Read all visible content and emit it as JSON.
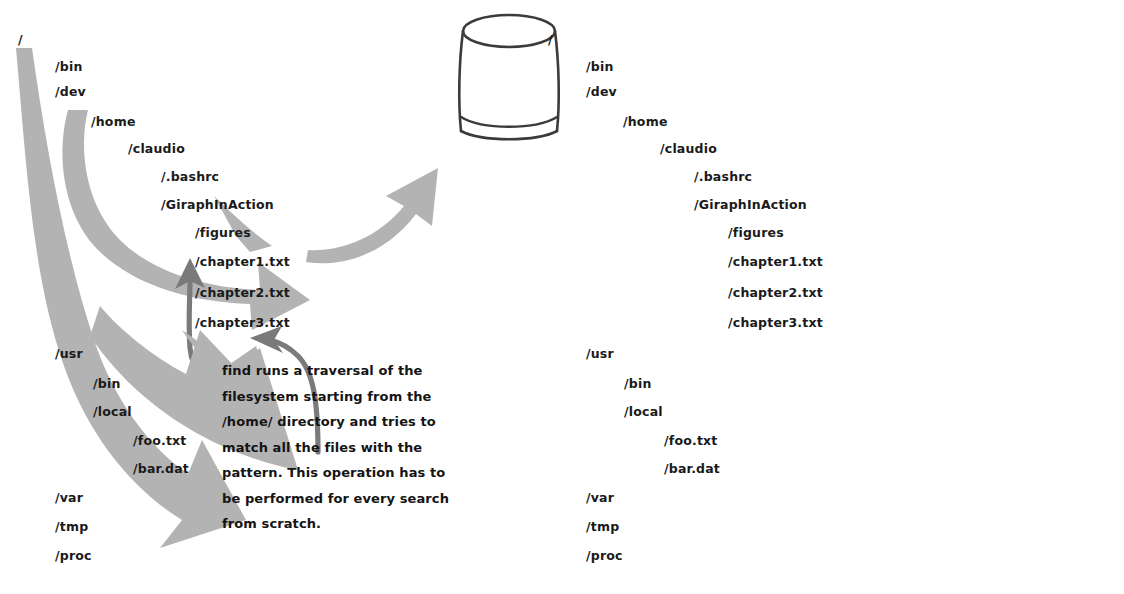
{
  "figure": {
    "background_color": "#ffffff",
    "text_color": "#1a1a1a",
    "arrow_fill": "#b3b3b3",
    "connector_stroke": "#7a7a7a",
    "database_stroke": "#3d3a38"
  },
  "panels": [
    {
      "id": "find",
      "name": "find-traversal-panel",
      "tree": {
        "name": "filesystem-tree-find",
        "nodes": [
          {
            "label": "/",
            "depth": 0,
            "x": 18,
            "y": 34
          },
          {
            "label": "/bin",
            "depth": 1,
            "x": 55,
            "y": 61
          },
          {
            "label": "/dev",
            "depth": 1,
            "x": 55,
            "y": 86
          },
          {
            "label": "/home",
            "depth": 2,
            "x": 91,
            "y": 116
          },
          {
            "label": "/claudio",
            "depth": 3,
            "x": 128,
            "y": 143
          },
          {
            "label": "/.bashrc",
            "depth": 4,
            "x": 161,
            "y": 171
          },
          {
            "label": "/GiraphInAction",
            "depth": 4,
            "x": 161,
            "y": 199
          },
          {
            "label": "/figures",
            "depth": 5,
            "x": 195,
            "y": 227
          },
          {
            "label": "/chapter1.txt",
            "depth": 5,
            "x": 195,
            "y": 256
          },
          {
            "label": "/chapter2.txt",
            "depth": 5,
            "x": 195,
            "y": 287
          },
          {
            "label": "/chapter3.txt",
            "depth": 5,
            "x": 195,
            "y": 317
          },
          {
            "label": "/usr",
            "depth": 1,
            "x": 55,
            "y": 348
          },
          {
            "label": "/bin",
            "depth": 2,
            "x": 93,
            "y": 378
          },
          {
            "label": "/local",
            "depth": 2,
            "x": 93,
            "y": 406
          },
          {
            "label": "/foo.txt",
            "depth": 3,
            "x": 133,
            "y": 435
          },
          {
            "label": "/bar.dat",
            "depth": 3,
            "x": 133,
            "y": 463
          },
          {
            "label": "/var",
            "depth": 1,
            "x": 55,
            "y": 492
          },
          {
            "label": "/tmp",
            "depth": 1,
            "x": 55,
            "y": 521
          },
          {
            "label": "/proc",
            "depth": 1,
            "x": 55,
            "y": 550
          }
        ]
      },
      "caption": {
        "name": "find-caption",
        "text": "find runs a traversal of the\nfilesystem starting from the\n/home/ directory and tries to\nmatch all the files with the\npattern. This operation has to\nbe performed for every search\nfrom scratch."
      },
      "annotations": {
        "traversal_arrow": "sweeping-gray-arrow",
        "connector_arrow": "caption-connector-arrow"
      }
    },
    {
      "id": "locate",
      "name": "locate-traversal-panel",
      "tree": {
        "name": "filesystem-tree-locate",
        "nodes": [
          {
            "label": "/",
            "depth": 0,
            "x": 548,
            "y": 34
          },
          {
            "label": "/bin",
            "depth": 1,
            "x": 586,
            "y": 61
          },
          {
            "label": "/dev",
            "depth": 1,
            "x": 586,
            "y": 86
          },
          {
            "label": "/home",
            "depth": 2,
            "x": 623,
            "y": 116
          },
          {
            "label": "/claudio",
            "depth": 3,
            "x": 660,
            "y": 143
          },
          {
            "label": "/.bashrc",
            "depth": 4,
            "x": 694,
            "y": 171
          },
          {
            "label": "/GiraphInAction",
            "depth": 4,
            "x": 694,
            "y": 199
          },
          {
            "label": "/figures",
            "depth": 5,
            "x": 728,
            "y": 227
          },
          {
            "label": "/chapter1.txt",
            "depth": 5,
            "x": 728,
            "y": 256
          },
          {
            "label": "/chapter2.txt",
            "depth": 5,
            "x": 728,
            "y": 287
          },
          {
            "label": "/chapter3.txt",
            "depth": 5,
            "x": 728,
            "y": 317
          },
          {
            "label": "/usr",
            "depth": 1,
            "x": 586,
            "y": 348
          },
          {
            "label": "/bin",
            "depth": 2,
            "x": 624,
            "y": 378
          },
          {
            "label": "/local",
            "depth": 2,
            "x": 624,
            "y": 406
          },
          {
            "label": "/foo.txt",
            "depth": 3,
            "x": 664,
            "y": 435
          },
          {
            "label": "/bar.dat",
            "depth": 3,
            "x": 664,
            "y": 463
          },
          {
            "label": "/var",
            "depth": 1,
            "x": 586,
            "y": 492
          },
          {
            "label": "/tmp",
            "depth": 1,
            "x": 586,
            "y": 521
          },
          {
            "label": "/proc",
            "depth": 1,
            "x": 586,
            "y": 550
          }
        ]
      },
      "caption": {
        "name": "locate-caption",
        "text": "locate.updatedb\nperiodically traverses the\nwhole filesystem and\nupdates the database.\nlocate uses the database\nfor its search queries,\nleveraging the work of\nlocate.updatedb to return\nresults quickly."
      },
      "annotations": {
        "traversal_arrow": "sweeping-gray-arrow",
        "connector_arrow": "caption-connector-arrow",
        "database_arrow": "curved-gray-arrow-to-database",
        "database_icon": "database-cylinder-icon"
      }
    }
  ]
}
